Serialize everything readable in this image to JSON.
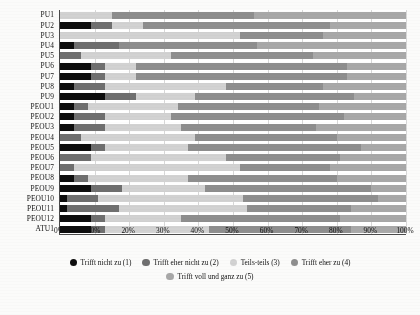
{
  "chart_data": {
    "type": "bar",
    "orientation": "horizontal",
    "stacked": true,
    "stack_mode": "percent",
    "title": "",
    "subtitle": "",
    "xlabel": "",
    "ylabel": "",
    "xlim": [
      0,
      100
    ],
    "grid": true,
    "legend_position": "bottom",
    "xtick_labels": [
      "0%",
      "10%",
      "20%",
      "30%",
      "40%",
      "50%",
      "60%",
      "70%",
      "80%",
      "90%",
      "100%"
    ],
    "xtick_values": [
      0,
      10,
      20,
      30,
      40,
      50,
      60,
      70,
      80,
      90,
      100
    ],
    "categories": [
      "PU1",
      "PU2",
      "PU3",
      "PU4",
      "PU5",
      "PU6",
      "PU7",
      "PU8",
      "PU9",
      "PEOU1",
      "PEOU2",
      "PEOU3",
      "PEOU4",
      "PEOU5",
      "PEOU6",
      "PEOU7",
      "PEOU8",
      "PEOU9",
      "PEOU10",
      "PEOU11",
      "PEOU12",
      "ATU1"
    ],
    "series": [
      {
        "name": "Trifft nicht zu (1)",
        "color": "#0d0d0d",
        "values": [
          0,
          9,
          0,
          4,
          0,
          9,
          9,
          4,
          13,
          4,
          4,
          4,
          0,
          9,
          0,
          0,
          4,
          9,
          2,
          2,
          9,
          9
        ]
      },
      {
        "name": "Trifft eher nicht zu (2)",
        "color": "#6f6f6f",
        "values": [
          0,
          6,
          0,
          13,
          6,
          4,
          4,
          9,
          9,
          4,
          9,
          9,
          6,
          4,
          9,
          4,
          4,
          9,
          9,
          15,
          4,
          4
        ]
      },
      {
        "name": "Teils-teils (3)",
        "color": "#d2d2d2",
        "values": [
          15,
          9,
          52,
          0,
          26,
          9,
          9,
          35,
          17,
          26,
          19,
          22,
          33,
          24,
          39,
          48,
          29,
          24,
          42,
          37,
          22,
          30
        ]
      },
      {
        "name": "Trifft eher zu (4)",
        "color": "#8e8e8e",
        "values": [
          41,
          54,
          24,
          40,
          41,
          61,
          61,
          28,
          46,
          41,
          50,
          39,
          41,
          50,
          33,
          26,
          43,
          48,
          39,
          30,
          46,
          41
        ]
      },
      {
        "name": "Trifft voll und ganz zu (5)",
        "color": "#a8a8a8",
        "values": [
          44,
          22,
          24,
          43,
          27,
          17,
          17,
          24,
          15,
          25,
          18,
          26,
          20,
          13,
          19,
          22,
          20,
          10,
          8,
          16,
          19,
          16
        ]
      }
    ]
  },
  "legend": {
    "items": [
      {
        "label": "Trifft nicht zu (1)"
      },
      {
        "label": "Trifft eher nicht zu (2)"
      },
      {
        "label": "Teils-teils (3)"
      },
      {
        "label": "Trifft eher zu (4)"
      },
      {
        "label": "Trifft voll und ganz zu (5)"
      }
    ]
  }
}
